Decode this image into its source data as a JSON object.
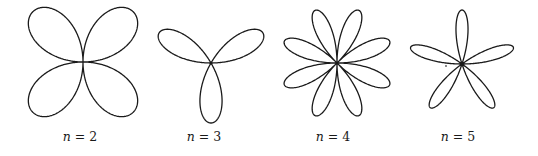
{
  "figure": {
    "stroke_color": "#1a1a1a",
    "background": "#ffffff",
    "curves": [
      {
        "n": 2,
        "label_var": "n",
        "label_rest": " = 2",
        "center": [
          83,
          62
        ],
        "radius": 71,
        "rotation_deg": 45,
        "label_center_x": 80
      },
      {
        "n": 3,
        "label_var": "n",
        "label_rest": " = 3",
        "center": [
          211,
          63
        ],
        "radius": 60,
        "rotation_deg": 90,
        "label_center_x": 204
      },
      {
        "n": 4,
        "label_var": "n",
        "label_rest": " = 4",
        "center": [
          337,
          63
        ],
        "radius": 57,
        "rotation_deg": 22.5,
        "label_center_x": 333
      },
      {
        "n": 5,
        "label_var": "n",
        "label_rest": " = 5",
        "center": [
          462,
          64
        ],
        "radius": 54,
        "rotation_deg": -90,
        "label_center_x": 458
      }
    ],
    "stray_dot": [
      446,
      66
    ]
  }
}
